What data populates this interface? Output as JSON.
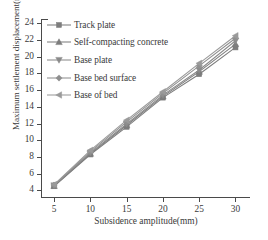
{
  "chart_data": {
    "type": "line",
    "title": "",
    "xlabel": "Subsidence amplitude(mm)",
    "ylabel": "Maximum settlement displacement(mm)",
    "x": [
      5,
      10,
      15,
      20,
      25,
      30
    ],
    "xlim": [
      3.2,
      32
    ],
    "ylim": [
      3.1,
      24.5
    ],
    "xticks": [
      5,
      10,
      15,
      20,
      25,
      30
    ],
    "yticks": [
      4,
      6,
      8,
      10,
      12,
      14,
      16,
      18,
      20,
      22,
      24
    ],
    "xtick_labels": [
      "5",
      "10",
      "15",
      "20",
      "25",
      "30"
    ],
    "ytick_labels": [
      "4",
      "6",
      "8",
      "10",
      "12",
      "14",
      "16",
      "18",
      "20",
      "22",
      "24"
    ],
    "grid": false,
    "legend_position": "upper-left-inside",
    "series": [
      {
        "name": "Track plate",
        "marker": "square",
        "color": "#7d7d7d",
        "values": [
          4.5,
          8.3,
          11.6,
          15.1,
          17.9,
          21.1
        ]
      },
      {
        "name": "Self-compacting concrete",
        "marker": "triangle-up",
        "color": "#7d7d7d",
        "values": [
          4.55,
          8.4,
          11.8,
          15.25,
          18.2,
          21.5
        ]
      },
      {
        "name": "Base plate",
        "marker": "triangle-down",
        "color": "#8a8a8a",
        "values": [
          4.6,
          8.5,
          11.95,
          15.4,
          18.4,
          21.9
        ]
      },
      {
        "name": "Base bed surface",
        "marker": "diamond",
        "color": "#8f8f8f",
        "values": [
          4.65,
          8.65,
          12.2,
          15.6,
          18.9,
          22.2
        ]
      },
      {
        "name": "Base of bed",
        "marker": "triangle-left",
        "color": "#9a9a9a",
        "values": [
          4.7,
          8.8,
          12.4,
          15.8,
          19.2,
          22.5
        ]
      }
    ]
  },
  "legend": {
    "items": [
      {
        "label": "Track plate"
      },
      {
        "label": "Self-compacting concrete"
      },
      {
        "label": "Base plate"
      },
      {
        "label": "Base bed surface"
      },
      {
        "label": "Base of bed"
      }
    ]
  }
}
